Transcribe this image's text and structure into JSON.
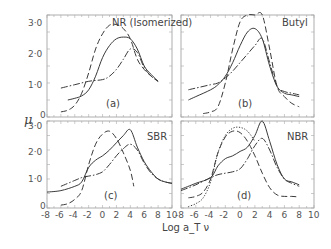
{
  "chart_data": {
    "type": "line",
    "ylabel": "μ",
    "xlabel": "Log a_T ν",
    "xlim": [
      -8,
      10
    ],
    "ylim": [
      0,
      3.0
    ],
    "x_ticks": [
      "-8",
      "-6",
      "-4",
      "-2",
      "0",
      "2",
      "4",
      "6",
      "8",
      "10"
    ],
    "y_ticks": [
      "0",
      "1·0",
      "2·0",
      "3·0"
    ],
    "grid": false,
    "panels": [
      {
        "id": "a",
        "panel_label": "(a)",
        "title": "NR (Isomerized)",
        "series": [
          {
            "name": "dashed",
            "style": "dashed",
            "x": [
              -6,
              -5,
              -4,
              -3,
              -2,
              -1,
              0,
              1,
              2,
              3,
              4,
              5,
              6,
              7,
              8
            ],
            "y": [
              0.15,
              0.2,
              0.35,
              0.7,
              1.3,
              2.0,
              2.45,
              2.7,
              2.72,
              2.6,
              2.3,
              1.7,
              1.4,
              1.2,
              1.05
            ]
          },
          {
            "name": "solid",
            "style": "solid",
            "x": [
              -5,
              -4,
              -3,
              -2,
              -1,
              0,
              1,
              2,
              3,
              4,
              5,
              6,
              7,
              8
            ],
            "y": [
              0.5,
              0.55,
              0.62,
              0.8,
              1.2,
              1.75,
              2.1,
              2.3,
              2.35,
              2.3,
              2.0,
              1.5,
              1.25,
              1.05
            ]
          },
          {
            "name": "dash-dot",
            "style": "dashdot",
            "x": [
              -6,
              -4,
              -2,
              0,
              1,
              2,
              3,
              4,
              5,
              6,
              7,
              8
            ],
            "y": [
              0.85,
              0.95,
              1.05,
              1.1,
              1.2,
              1.4,
              1.7,
              2.0,
              1.9,
              1.45,
              1.2,
              1.05
            ]
          }
        ]
      },
      {
        "id": "b",
        "panel_label": "(b)",
        "title": "Butyl",
        "series": [
          {
            "name": "dashed",
            "style": "dashed",
            "x": [
              -5,
              -4,
              -3,
              -2,
              -1,
              0,
              1,
              2,
              3,
              4,
              5,
              6,
              7,
              8
            ],
            "y": [
              0.1,
              0.15,
              0.3,
              1.0,
              2.0,
              2.8,
              3.3,
              3.5,
              3.3,
              2.0,
              0.9,
              0.6,
              0.4,
              0.3
            ]
          },
          {
            "name": "solid",
            "style": "solid",
            "x": [
              -7,
              -6,
              -4,
              -3,
              -2,
              -1,
              0,
              1,
              2,
              3,
              4,
              5,
              6,
              7,
              8
            ],
            "y": [
              0.5,
              0.6,
              0.8,
              0.95,
              1.2,
              1.6,
              2.1,
              2.5,
              2.6,
              2.3,
              1.5,
              0.9,
              0.7,
              0.65,
              0.6
            ]
          },
          {
            "name": "dash-dot",
            "style": "dashdot",
            "x": [
              -7,
              -6,
              -4,
              -3,
              -2,
              -1,
              0,
              1,
              2,
              3,
              4,
              5,
              6,
              7,
              8
            ],
            "y": [
              0.8,
              0.85,
              0.95,
              1.0,
              1.15,
              1.35,
              1.6,
              1.85,
              2.1,
              2.3,
              1.6,
              0.9,
              0.75,
              0.7,
              0.65
            ]
          }
        ]
      },
      {
        "id": "c",
        "panel_label": "(c)",
        "title": "SBR",
        "series": [
          {
            "name": "dashed",
            "style": "dashed",
            "x": [
              -6,
              -5,
              -4,
              -3,
              -2,
              -1,
              0,
              1,
              2,
              3,
              4,
              4.5
            ],
            "y": [
              0.1,
              0.15,
              0.3,
              0.6,
              1.5,
              2.2,
              2.55,
              2.65,
              2.4,
              1.9,
              1.3,
              0.75
            ]
          },
          {
            "name": "solid",
            "style": "solid",
            "x": [
              -8,
              -6,
              -4,
              -3,
              -2,
              -1,
              0,
              1,
              2,
              3,
              4,
              5,
              6,
              7,
              8,
              9,
              10
            ],
            "y": [
              0.55,
              0.6,
              0.75,
              0.9,
              1.4,
              1.65,
              1.8,
              2.0,
              2.25,
              2.5,
              2.7,
              2.1,
              1.6,
              1.25,
              1.0,
              0.9,
              0.85
            ]
          },
          {
            "name": "dash-dot",
            "style": "dashdot",
            "x": [
              -6,
              -4,
              -3,
              -2,
              -1,
              0,
              1,
              2,
              3,
              4,
              5,
              6,
              7,
              8,
              9,
              10
            ],
            "y": [
              0.75,
              0.95,
              1.05,
              1.1,
              1.15,
              1.25,
              1.5,
              1.8,
              2.05,
              2.2,
              2.0,
              1.55,
              1.2,
              1.0,
              0.9,
              0.85
            ]
          }
        ]
      },
      {
        "id": "d",
        "panel_label": "(d)",
        "title": "NBR",
        "series": [
          {
            "name": "dotted",
            "style": "dotted",
            "x": [
              -7,
              -6,
              -5,
              -4,
              -3,
              -2,
              -1,
              0,
              1,
              2
            ],
            "y": [
              0.05,
              0.15,
              0.35,
              0.9,
              1.9,
              2.5,
              2.75,
              2.78,
              2.65,
              2.3
            ]
          },
          {
            "name": "dashed",
            "style": "dashed",
            "x": [
              -7,
              -6,
              -5,
              -4,
              -3,
              -2,
              -1,
              0,
              1,
              2,
              3,
              4,
              5,
              6,
              7,
              8
            ],
            "y": [
              0.35,
              0.4,
              0.55,
              1.0,
              1.9,
              2.45,
              2.65,
              2.6,
              2.3,
              1.8,
              1.2,
              0.7,
              0.45,
              0.4,
              0.4,
              0.38
            ]
          },
          {
            "name": "solid",
            "style": "solid",
            "x": [
              -8,
              -6,
              -4,
              -3,
              -2,
              -1,
              0,
              1,
              2,
              3,
              4,
              5,
              6,
              7,
              8
            ],
            "y": [
              0.65,
              0.85,
              1.05,
              1.45,
              1.7,
              1.8,
              1.95,
              2.1,
              2.5,
              3.0,
              2.3,
              1.5,
              1.0,
              0.9,
              0.8
            ]
          },
          {
            "name": "dash-dot",
            "style": "dashdot",
            "x": [
              -8,
              -6,
              -4,
              -3,
              -2,
              -1,
              0,
              1,
              2,
              3,
              4,
              5,
              6,
              7,
              8
            ],
            "y": [
              0.6,
              0.8,
              1.05,
              1.15,
              1.2,
              1.25,
              1.35,
              1.7,
              2.15,
              2.4,
              2.0,
              1.4,
              1.0,
              0.85,
              0.75
            ]
          }
        ]
      }
    ]
  }
}
